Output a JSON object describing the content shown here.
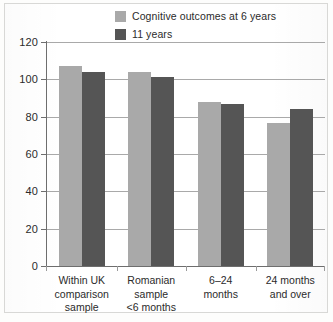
{
  "chart_data": {
    "type": "bar",
    "title": "",
    "subtitle": "",
    "xlabel": "",
    "ylabel": "",
    "ylim": [
      0,
      120
    ],
    "yticks": [
      0,
      20,
      40,
      60,
      80,
      100,
      120
    ],
    "ytick_labels": [
      "0",
      "20",
      "40",
      "60",
      "80",
      "100",
      "120"
    ],
    "grid": true,
    "legend_position": "top-right-inside",
    "categories": [
      "Within UK comparison sample",
      "Romanian sample <6 months",
      "6–24 months",
      "24 months and over"
    ],
    "category_label_lines": [
      [
        "Within UK",
        "comparison",
        "sample"
      ],
      [
        "Romanian",
        "sample",
        "<6 months"
      ],
      [
        "6–24",
        "months"
      ],
      [
        "24 months",
        "and over"
      ]
    ],
    "series": [
      {
        "name": "Cognitive outcomes at 6 years",
        "color": "#a9a9a9",
        "values": [
          107,
          104,
          88,
          76.5
        ]
      },
      {
        "name": "11 years",
        "color": "#555555",
        "values": [
          104,
          101.5,
          87,
          84
        ]
      }
    ]
  },
  "colors": {
    "series_light": "#a9a9a9",
    "series_dark": "#555555",
    "axis": "#6e6e6e",
    "grid": "#a9a9a9",
    "text": "#2b2b2b",
    "page_background": "#ffffff"
  }
}
